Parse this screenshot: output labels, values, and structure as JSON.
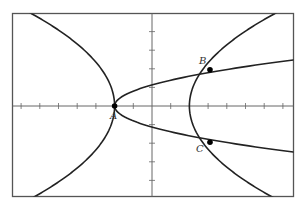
{
  "chart_data": {
    "type": "line",
    "title": "",
    "xlabel": "",
    "ylabel": "",
    "grid": false,
    "axis_ticks": {
      "x": [
        -7,
        -6,
        -5,
        -4,
        -3,
        -2,
        -1,
        1,
        2,
        3,
        4,
        5,
        6,
        7
      ],
      "y": [
        -4,
        -3,
        -2,
        -1,
        1,
        2,
        3,
        4
      ]
    },
    "xlim": [
      -7.5,
      7.5
    ],
    "ylim": [
      -4.9,
      5.0
    ],
    "curves": [
      {
        "name": "left-branch",
        "form": "x = -2 - 0.18*y^2",
        "vertex": [
          -2,
          0
        ]
      },
      {
        "name": "sideways-parabola",
        "form": "x = -2 + 1.56*y^2",
        "vertex": [
          -2,
          0
        ]
      },
      {
        "name": "right-branch",
        "form": "x = 2 + 0.185*y^2",
        "vertex": [
          2,
          0
        ]
      }
    ],
    "points": [
      {
        "label": "A",
        "x": -2,
        "y": 0
      },
      {
        "label": "B",
        "x": 3.1,
        "y": 1.95
      },
      {
        "label": "C",
        "x": 3.1,
        "y": -1.95
      }
    ]
  },
  "labels": {
    "A": "A",
    "B": "B",
    "C": "C"
  },
  "colors": {
    "curve": "#222222",
    "frame": "#555555",
    "axis": "#666666",
    "point": "#000000"
  }
}
